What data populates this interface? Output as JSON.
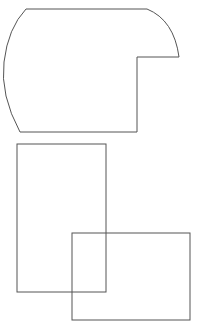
{
  "canvas": {
    "width": 203,
    "height": 332,
    "background": "#ffffff"
  },
  "stroke_color": "#555555",
  "shapes": [
    {
      "id": "rounded-notched-shape",
      "type": "path",
      "d": "M 26 9 L 147 9 Q 174 20 179 57 L 137 57 L 137 132 L 20 132 Q 0 95 4 62 Q 8 28 26 9 Z"
    },
    {
      "id": "rect-1",
      "type": "rect",
      "x": 17,
      "y": 144,
      "width": 89,
      "height": 148
    },
    {
      "id": "rect-2",
      "type": "rect",
      "x": 72,
      "y": 233,
      "width": 118,
      "height": 87
    }
  ]
}
